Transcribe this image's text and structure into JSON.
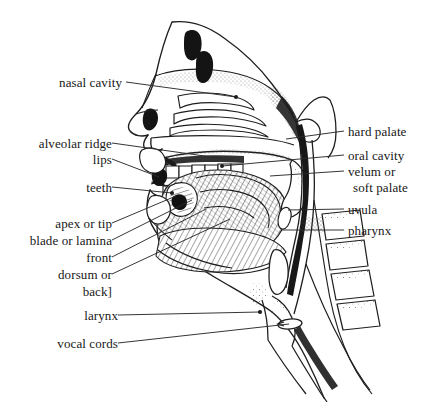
{
  "figure": {
    "type": "anatomical-diagram",
    "background_color": "#ffffff",
    "ink_color": "#171717",
    "line_color": "#2b2b2b"
  },
  "labels_left": [
    {
      "id": "nasal-cavity",
      "text": "nasal cavity",
      "x": 122,
      "y": 84,
      "leader_to_x": 236,
      "leader_to_y": 97,
      "has_dot": true
    },
    {
      "id": "alveolar-ridge",
      "text": "alveolar ridge",
      "x": 100,
      "y": 145,
      "leader_to_x": 233,
      "leader_to_y": 160,
      "has_dot": false
    },
    {
      "id": "lips",
      "text": "lips",
      "x": 100,
      "y": 160,
      "leader_to_x": 159,
      "leader_to_y": 178,
      "has_dot": false
    },
    {
      "id": "teeth",
      "text": "teeth",
      "x": 103,
      "y": 188,
      "leader_to_x": 173,
      "leader_to_y": 193,
      "has_dot": true
    },
    {
      "id": "apex-or-tip",
      "text": "apex or tip",
      "x": 100,
      "y": 225,
      "leader_to_x": 175,
      "leader_to_y": 196,
      "has_dot": false
    },
    {
      "id": "blade-or-lamina",
      "text": "blade or lamina",
      "x": 105,
      "y": 242,
      "leader_to_x": 190,
      "leader_to_y": 200,
      "has_dot": false
    },
    {
      "id": "front",
      "text": "front",
      "x": 100,
      "y": 259,
      "leader_to_x": 205,
      "leader_to_y": 208,
      "has_dot": false
    },
    {
      "id": "dorsum-or",
      "text": "dorsum or",
      "x": 100,
      "y": 276,
      "leader_to_x": 228,
      "leader_to_y": 218,
      "has_dot": false
    },
    {
      "id": "back-bracket",
      "text": "back]",
      "x": 100,
      "y": 292,
      "leader_to_x": null,
      "leader_to_y": null,
      "has_dot": false
    },
    {
      "id": "larynx",
      "text": "larynx",
      "x": 102,
      "y": 318,
      "leader_to_x": 260,
      "leader_to_y": 313,
      "has_dot": true
    },
    {
      "id": "vocal-cords",
      "text": "vocal cords",
      "x": 104,
      "y": 345,
      "leader_to_x": 290,
      "leader_to_y": 324,
      "has_dot": false
    }
  ],
  "labels_right": [
    {
      "id": "hard-palate",
      "text": "hard palate",
      "x": 348,
      "y": 132,
      "leader_to_x": 286,
      "leader_to_y": 139,
      "has_dot": false
    },
    {
      "id": "oral-cavity",
      "text": "oral cavity",
      "x": 348,
      "y": 156,
      "leader_to_x": 222,
      "leader_to_y": 166,
      "has_dot": true
    },
    {
      "id": "velum-or",
      "text": "velum or",
      "x": 348,
      "y": 172,
      "leader_to_x": 270,
      "leader_to_y": 176,
      "has_dot": false
    },
    {
      "id": "soft-palate",
      "text": "soft palate",
      "x": 348,
      "y": 188,
      "leader_to_x": null,
      "leader_to_y": null,
      "has_dot": false
    },
    {
      "id": "uvula",
      "text": "uvula",
      "x": 348,
      "y": 210,
      "leader_to_x": 287,
      "leader_to_y": 210,
      "has_dot": false
    },
    {
      "id": "pharynx",
      "text": "pharynx",
      "x": 348,
      "y": 231,
      "leader_to_x": 281,
      "leader_to_y": 231,
      "has_dot": false
    }
  ],
  "anatomy_parts": [
    "face-profile",
    "nasal-cavity",
    "nasal-turbinates",
    "nostril",
    "hard-palate",
    "alveolar-ridge",
    "upper-teeth",
    "lower-teeth",
    "upper-lip",
    "lower-lip",
    "tongue-body",
    "tongue-tip",
    "velum",
    "uvula",
    "pharynx-wall",
    "epiglottis",
    "larynx",
    "vocal-cords",
    "trachea",
    "cervical-vertebrae",
    "mandible",
    "sphenoid-sinus"
  ]
}
